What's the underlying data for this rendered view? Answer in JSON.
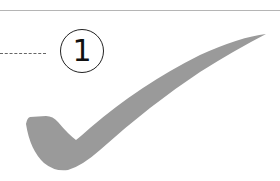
{
  "callout": {
    "number": "1"
  },
  "checkmark": {
    "fill": "#9a9a9a"
  },
  "colors": {
    "rule": "#b5b5b5",
    "leader": "#666666",
    "circle": "#222222"
  }
}
